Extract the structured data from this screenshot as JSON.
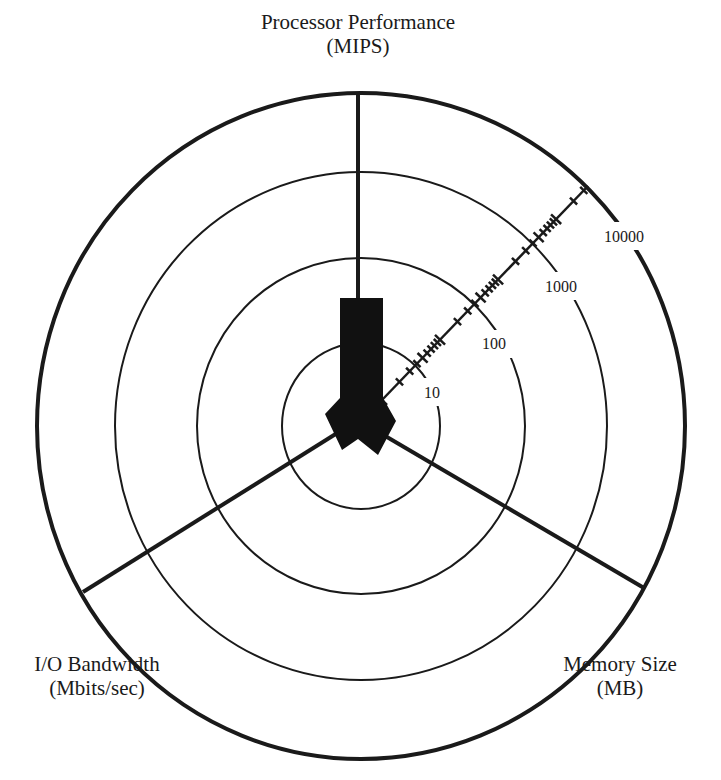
{
  "diagram": {
    "axes": [
      {
        "id": "processor",
        "label_line1": "Processor Performance",
        "label_line2": "(MIPS)"
      },
      {
        "id": "io",
        "label_line1": "I/O Bandwidth",
        "label_line2": "(Mbits/sec)"
      },
      {
        "id": "memory",
        "label_line1": "Memory Size",
        "label_line2": "(MB)"
      }
    ],
    "scale": {
      "type": "logarithmic",
      "ring_labels": [
        "10",
        "100",
        "1000",
        "10000"
      ]
    },
    "colors": {
      "ink": "#1a1a1a",
      "background": "#ffffff"
    }
  }
}
